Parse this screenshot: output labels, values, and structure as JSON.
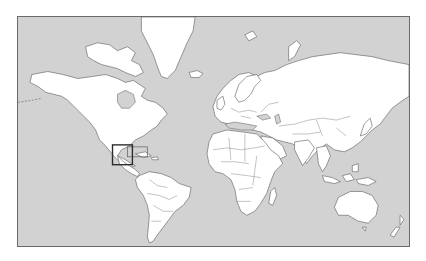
{
  "map": {
    "projection": "world-mercator",
    "colors": {
      "ocean": "#d2d2d2",
      "land": "#ffffff",
      "coastline": "#5a5a5a",
      "frame": "#6a6a6a",
      "highlight": "#2b2b2b"
    },
    "highlight": {
      "region": "Central America",
      "primary_box": {
        "x": 112,
        "y": 145,
        "w": 20,
        "h": 20
      },
      "secondary_box": {
        "x": 127,
        "y": 147,
        "w": 20,
        "h": 10
      }
    }
  }
}
